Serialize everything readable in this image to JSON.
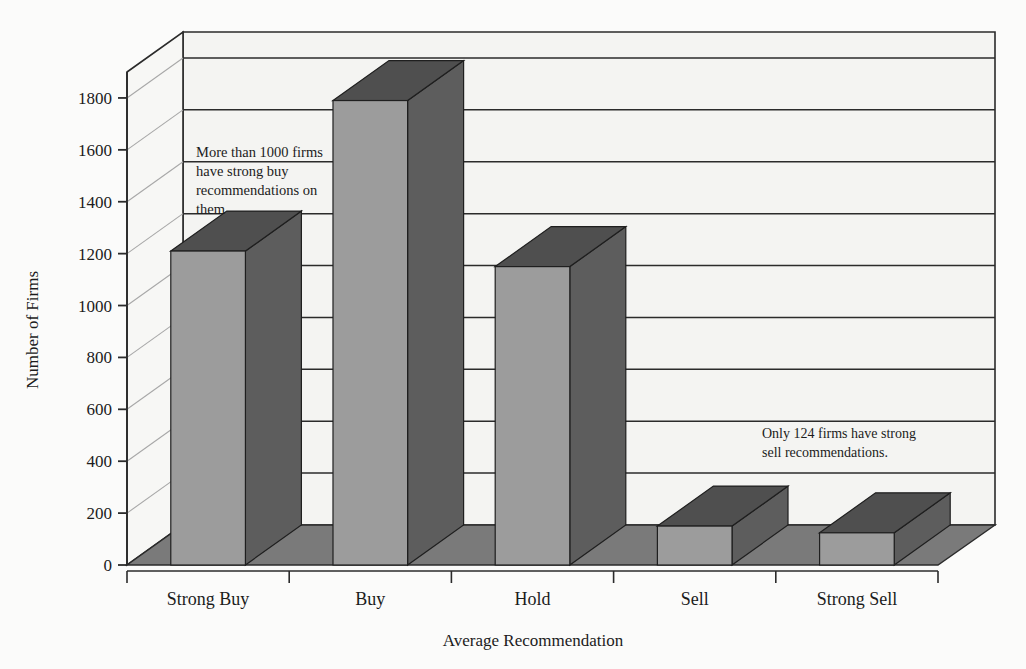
{
  "chart_data": {
    "type": "bar",
    "title": "",
    "subtitle": "",
    "xlabel": "Average Recommendation",
    "ylabel": "Number of Firms",
    "categories": [
      "Strong Buy",
      "Buy",
      "Hold",
      "Sell",
      "Strong Sell"
    ],
    "values": [
      1210,
      1790,
      1150,
      150,
      124
    ],
    "ylim": [
      0,
      1900
    ],
    "yticks": [
      0,
      200,
      400,
      600,
      800,
      1000,
      1200,
      1400,
      1600,
      1800
    ],
    "ytick_labels": [
      "0",
      "200",
      "400",
      "600",
      "800",
      "1000",
      "1200",
      "1400",
      "1600",
      "1800"
    ],
    "grid": true,
    "legend": false,
    "legend_position": "none",
    "style": "3d-column",
    "colors": {
      "bar_front": "#9c9c9c",
      "bar_side": "#5d5d5d",
      "bar_top": "#4f4f4f",
      "bar_outline": "#1f1f1f",
      "floor": "#7a7a7a",
      "wall": "#f4f4f2",
      "gridline": "#2b2b2b",
      "axis": "#2b2b2b",
      "background": "#fbfbfa",
      "text": "#1c1c1c"
    },
    "annotations": [
      {
        "name": "strong-buy-note",
        "lines": [
          "More than 1000 firms",
          "have strong buy",
          "recommendations on",
          "them"
        ],
        "x": 196,
        "y": 157,
        "align": "start"
      },
      {
        "name": "strong-sell-note",
        "lines": [
          "Only 124 firms have strong",
          "sell recommendations."
        ],
        "x": 762,
        "y": 438,
        "align": "start"
      }
    ]
  }
}
